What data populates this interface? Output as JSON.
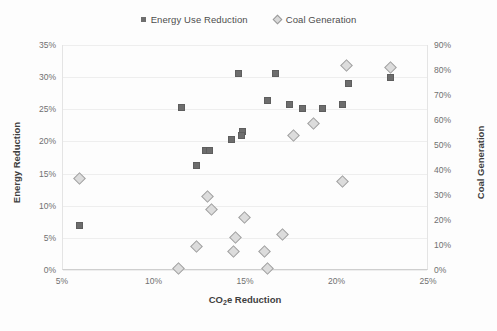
{
  "chart_data": {
    "type": "scatter",
    "title": "",
    "xlabel": "CO2e Reduction",
    "xlabel_parts": {
      "pre": "CO",
      "sub": "2",
      "post": "e Reduction"
    },
    "ylabel": "Energy Reduction",
    "ylabel_right": "Coal Generation",
    "xlim": [
      5,
      25
    ],
    "ylim": [
      0,
      35
    ],
    "ylim_right": [
      0,
      90
    ],
    "grid": true,
    "legend_position": "top-center",
    "x_ticks": [
      "5%",
      "10%",
      "15%",
      "20%",
      "25%"
    ],
    "x_tick_values": [
      5,
      10,
      15,
      20,
      25
    ],
    "y_ticks_left": [
      "0%",
      "5%",
      "10%",
      "15%",
      "20%",
      "25%",
      "30%",
      "35%"
    ],
    "y_tick_values_left": [
      0,
      5,
      10,
      15,
      20,
      25,
      30,
      35
    ],
    "y_ticks_right": [
      "0%",
      "10%",
      "20%",
      "30%",
      "40%",
      "50%",
      "60%",
      "70%",
      "80%",
      "90%"
    ],
    "y_tick_values_right": [
      0,
      10,
      20,
      30,
      40,
      50,
      60,
      70,
      80,
      90
    ],
    "series": [
      {
        "name": "Energy Use Reduction",
        "marker": "square",
        "color": "#6d6d6d",
        "axis": "left",
        "points": [
          {
            "x": 5.9,
            "y": 6.9
          },
          {
            "x": 12.3,
            "y": 16.2
          },
          {
            "x": 12.8,
            "y": 18.6
          },
          {
            "x": 13.0,
            "y": 18.6
          },
          {
            "x": 14.2,
            "y": 20.3
          },
          {
            "x": 14.8,
            "y": 21.5
          },
          {
            "x": 14.75,
            "y": 20.9
          },
          {
            "x": 11.5,
            "y": 25.3
          },
          {
            "x": 14.6,
            "y": 30.5
          },
          {
            "x": 16.6,
            "y": 30.5
          },
          {
            "x": 16.2,
            "y": 26.4
          },
          {
            "x": 17.4,
            "y": 25.8
          },
          {
            "x": 18.1,
            "y": 25.1
          },
          {
            "x": 19.2,
            "y": 25.1
          },
          {
            "x": 20.3,
            "y": 25.8
          },
          {
            "x": 20.6,
            "y": 29.0
          },
          {
            "x": 22.9,
            "y": 29.9
          }
        ]
      },
      {
        "name": "Coal Generation",
        "marker": "diamond",
        "color": "#dcdcdc",
        "axis": "right",
        "points": [
          {
            "x": 5.9,
            "y": 36.5
          },
          {
            "x": 11.3,
            "y": 0.5
          },
          {
            "x": 12.3,
            "y": 9.3
          },
          {
            "x": 12.9,
            "y": 29.3
          },
          {
            "x": 13.1,
            "y": 24.3
          },
          {
            "x": 14.4,
            "y": 13.2
          },
          {
            "x": 14.3,
            "y": 7.3
          },
          {
            "x": 14.9,
            "y": 21.2
          },
          {
            "x": 16.0,
            "y": 7.3
          },
          {
            "x": 16.2,
            "y": 0.5
          },
          {
            "x": 17.0,
            "y": 14.2
          },
          {
            "x": 17.6,
            "y": 54.0
          },
          {
            "x": 18.7,
            "y": 58.7
          },
          {
            "x": 20.3,
            "y": 35.6
          },
          {
            "x": 20.5,
            "y": 82.0
          },
          {
            "x": 22.9,
            "y": 81.0
          }
        ]
      }
    ]
  },
  "legend": {
    "items": [
      {
        "label": "Energy Use Reduction",
        "marker": "square"
      },
      {
        "label": "Coal Generation",
        "marker": "diamond"
      }
    ]
  },
  "colors": {
    "square_fill": "#6d6d6d",
    "diamond_fill": "#dcdcdc",
    "diamond_stroke": "#a2a2a2",
    "grid": "#eeeeee",
    "axis": "#cfcfcf",
    "text": "#707070"
  }
}
